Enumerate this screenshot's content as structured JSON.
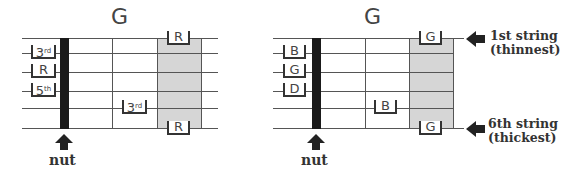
{
  "left_diagram": {
    "title": "G",
    "nut_label": "nut",
    "open_notes": [
      {
        "string": 2,
        "text": "3",
        "sup": "rd"
      },
      {
        "string": 3,
        "text": "R",
        "sup": ""
      },
      {
        "string": 4,
        "text": "5",
        "sup": "th"
      }
    ],
    "fretted_notes": [
      {
        "string": 1,
        "fret": 3,
        "text": "R",
        "sup": ""
      },
      {
        "string": 5,
        "fret": 2,
        "text": "3",
        "sup": "rd"
      },
      {
        "string": 6,
        "fret": 3,
        "text": "R",
        "sup": ""
      }
    ]
  },
  "right_diagram": {
    "title": "G",
    "nut_label": "nut",
    "open_notes": [
      {
        "string": 2,
        "text": "B"
      },
      {
        "string": 3,
        "text": "G"
      },
      {
        "string": 4,
        "text": "D"
      }
    ],
    "fretted_notes": [
      {
        "string": 1,
        "fret": 3,
        "text": "G"
      },
      {
        "string": 5,
        "fret": 2,
        "text": "B"
      },
      {
        "string": 6,
        "fret": 3,
        "text": "G"
      }
    ],
    "string_labels": {
      "first_line1": "1st string",
      "first_line2": "(thinnest)",
      "sixth_line1": "6th string",
      "sixth_line2": "(thickest)"
    }
  },
  "colors": {
    "shaded_fret": "#d6d6d6",
    "nut": "#1a1a1a",
    "string": "#555555"
  }
}
